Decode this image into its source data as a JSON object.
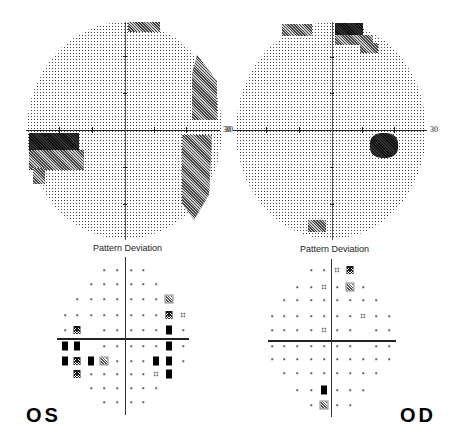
{
  "left_eye": {
    "label": "OS",
    "grey_scale": {
      "axis_label_right": "30"
    },
    "pattern_deviation": {
      "title": "Pattern Deviation",
      "points": [
        {
          "x": 104,
          "y": 270,
          "t": "dot"
        },
        {
          "x": 117,
          "y": 270,
          "t": "dot"
        },
        {
          "x": 131,
          "y": 270,
          "t": "dot"
        },
        {
          "x": 143,
          "y": 270,
          "t": "dot"
        },
        {
          "x": 91,
          "y": 284,
          "t": "dot"
        },
        {
          "x": 104,
          "y": 284,
          "t": "dot"
        },
        {
          "x": 117,
          "y": 284,
          "t": "dot"
        },
        {
          "x": 131,
          "y": 284,
          "t": "dot"
        },
        {
          "x": 143,
          "y": 284,
          "t": "dot"
        },
        {
          "x": 156,
          "y": 284,
          "t": "dot"
        },
        {
          "x": 77,
          "y": 299,
          "t": "dot"
        },
        {
          "x": 91,
          "y": 299,
          "t": "dot"
        },
        {
          "x": 104,
          "y": 299,
          "t": "dot"
        },
        {
          "x": 117,
          "y": 299,
          "t": "dot"
        },
        {
          "x": 131,
          "y": 299,
          "t": "dot"
        },
        {
          "x": 143,
          "y": 299,
          "t": "dot"
        },
        {
          "x": 156,
          "y": 299,
          "t": "dot"
        },
        {
          "x": 169,
          "y": 299,
          "t": "hatch"
        },
        {
          "x": 65,
          "y": 315,
          "t": "dot"
        },
        {
          "x": 77,
          "y": 315,
          "t": "dot"
        },
        {
          "x": 91,
          "y": 315,
          "t": "dot"
        },
        {
          "x": 104,
          "y": 315,
          "t": "dot"
        },
        {
          "x": 117,
          "y": 315,
          "t": "dot"
        },
        {
          "x": 131,
          "y": 315,
          "t": "dot"
        },
        {
          "x": 143,
          "y": 315,
          "t": "dot"
        },
        {
          "x": 156,
          "y": 315,
          "t": "dot"
        },
        {
          "x": 169,
          "y": 315,
          "t": "cross"
        },
        {
          "x": 183,
          "y": 315,
          "t": "4dot"
        },
        {
          "x": 65,
          "y": 330,
          "t": "dot"
        },
        {
          "x": 77,
          "y": 330,
          "t": "cross"
        },
        {
          "x": 104,
          "y": 330,
          "t": "dot"
        },
        {
          "x": 117,
          "y": 330,
          "t": "dot"
        },
        {
          "x": 131,
          "y": 330,
          "t": "dot"
        },
        {
          "x": 143,
          "y": 330,
          "t": "dot"
        },
        {
          "x": 156,
          "y": 330,
          "t": "dot"
        },
        {
          "x": 169,
          "y": 330,
          "t": "solid"
        },
        {
          "x": 183,
          "y": 330,
          "t": "dot"
        },
        {
          "x": 65,
          "y": 346,
          "t": "solid"
        },
        {
          "x": 77,
          "y": 346,
          "t": "solid"
        },
        {
          "x": 104,
          "y": 346,
          "t": "dot"
        },
        {
          "x": 117,
          "y": 346,
          "t": "dot"
        },
        {
          "x": 131,
          "y": 346,
          "t": "dot"
        },
        {
          "x": 143,
          "y": 346,
          "t": "dot"
        },
        {
          "x": 156,
          "y": 346,
          "t": "dot"
        },
        {
          "x": 169,
          "y": 346,
          "t": "solid"
        },
        {
          "x": 183,
          "y": 346,
          "t": "dot"
        },
        {
          "x": 65,
          "y": 361,
          "t": "solid"
        },
        {
          "x": 77,
          "y": 361,
          "t": "cross"
        },
        {
          "x": 91,
          "y": 361,
          "t": "solid"
        },
        {
          "x": 104,
          "y": 361,
          "t": "hatch"
        },
        {
          "x": 117,
          "y": 361,
          "t": "dot"
        },
        {
          "x": 131,
          "y": 361,
          "t": "dot"
        },
        {
          "x": 143,
          "y": 361,
          "t": "dot"
        },
        {
          "x": 156,
          "y": 361,
          "t": "solid"
        },
        {
          "x": 169,
          "y": 361,
          "t": "solid"
        },
        {
          "x": 183,
          "y": 361,
          "t": "dot"
        },
        {
          "x": 77,
          "y": 374,
          "t": "cross"
        },
        {
          "x": 91,
          "y": 374,
          "t": "dot"
        },
        {
          "x": 104,
          "y": 374,
          "t": "dot"
        },
        {
          "x": 117,
          "y": 374,
          "t": "dot"
        },
        {
          "x": 131,
          "y": 374,
          "t": "dot"
        },
        {
          "x": 143,
          "y": 374,
          "t": "dot"
        },
        {
          "x": 156,
          "y": 374,
          "t": "4dot"
        },
        {
          "x": 169,
          "y": 374,
          "t": "solid"
        },
        {
          "x": 91,
          "y": 388,
          "t": "dot"
        },
        {
          "x": 104,
          "y": 388,
          "t": "dot"
        },
        {
          "x": 117,
          "y": 388,
          "t": "dot"
        },
        {
          "x": 131,
          "y": 388,
          "t": "dot"
        },
        {
          "x": 143,
          "y": 388,
          "t": "dot"
        },
        {
          "x": 156,
          "y": 388,
          "t": "dot"
        },
        {
          "x": 104,
          "y": 402,
          "t": "dot"
        },
        {
          "x": 117,
          "y": 402,
          "t": "dot"
        },
        {
          "x": 131,
          "y": 402,
          "t": "dot"
        },
        {
          "x": 143,
          "y": 402,
          "t": "dot"
        }
      ]
    }
  },
  "right_eye": {
    "label": "OD",
    "grey_scale": {
      "axis_label_left": "30",
      "axis_label_right": "30"
    },
    "pattern_deviation": {
      "title": "Pattern Deviation",
      "points": [
        {
          "x": 311,
          "y": 270,
          "t": "dot"
        },
        {
          "x": 324,
          "y": 270,
          "t": "dot"
        },
        {
          "x": 337,
          "y": 270,
          "t": "4dot"
        },
        {
          "x": 350,
          "y": 270,
          "t": "cross"
        },
        {
          "x": 297,
          "y": 287,
          "t": "dot"
        },
        {
          "x": 311,
          "y": 287,
          "t": "dot"
        },
        {
          "x": 324,
          "y": 287,
          "t": "4dot"
        },
        {
          "x": 337,
          "y": 287,
          "t": "dot"
        },
        {
          "x": 350,
          "y": 287,
          "t": "hatch"
        },
        {
          "x": 363,
          "y": 287,
          "t": "dot"
        },
        {
          "x": 284,
          "y": 300,
          "t": "dot"
        },
        {
          "x": 297,
          "y": 300,
          "t": "dot"
        },
        {
          "x": 311,
          "y": 300,
          "t": "dot"
        },
        {
          "x": 324,
          "y": 300,
          "t": "dot"
        },
        {
          "x": 337,
          "y": 300,
          "t": "dot"
        },
        {
          "x": 350,
          "y": 300,
          "t": "dot"
        },
        {
          "x": 363,
          "y": 300,
          "t": "dot"
        },
        {
          "x": 376,
          "y": 300,
          "t": "dot"
        },
        {
          "x": 272,
          "y": 316,
          "t": "dot"
        },
        {
          "x": 284,
          "y": 316,
          "t": "dot"
        },
        {
          "x": 297,
          "y": 316,
          "t": "dot"
        },
        {
          "x": 311,
          "y": 316,
          "t": "dot"
        },
        {
          "x": 324,
          "y": 316,
          "t": "dot"
        },
        {
          "x": 337,
          "y": 316,
          "t": "dot"
        },
        {
          "x": 350,
          "y": 316,
          "t": "dot"
        },
        {
          "x": 363,
          "y": 316,
          "t": "4dot"
        },
        {
          "x": 376,
          "y": 316,
          "t": "dot"
        },
        {
          "x": 389,
          "y": 316,
          "t": "dot"
        },
        {
          "x": 272,
          "y": 330,
          "t": "dot"
        },
        {
          "x": 284,
          "y": 330,
          "t": "dot"
        },
        {
          "x": 297,
          "y": 330,
          "t": "dot"
        },
        {
          "x": 311,
          "y": 330,
          "t": "dot"
        },
        {
          "x": 324,
          "y": 330,
          "t": "4dot"
        },
        {
          "x": 337,
          "y": 330,
          "t": "dot"
        },
        {
          "x": 350,
          "y": 330,
          "t": "dot"
        },
        {
          "x": 376,
          "y": 330,
          "t": "dot"
        },
        {
          "x": 389,
          "y": 330,
          "t": "dot"
        },
        {
          "x": 272,
          "y": 346,
          "t": "dot"
        },
        {
          "x": 284,
          "y": 346,
          "t": "dot"
        },
        {
          "x": 297,
          "y": 346,
          "t": "dot"
        },
        {
          "x": 311,
          "y": 346,
          "t": "dot"
        },
        {
          "x": 324,
          "y": 346,
          "t": "dot"
        },
        {
          "x": 337,
          "y": 346,
          "t": "dot"
        },
        {
          "x": 350,
          "y": 346,
          "t": "dot"
        },
        {
          "x": 376,
          "y": 346,
          "t": "dot"
        },
        {
          "x": 389,
          "y": 346,
          "t": "dot"
        },
        {
          "x": 272,
          "y": 359,
          "t": "dot"
        },
        {
          "x": 284,
          "y": 359,
          "t": "dot"
        },
        {
          "x": 297,
          "y": 359,
          "t": "dot"
        },
        {
          "x": 311,
          "y": 359,
          "t": "dot"
        },
        {
          "x": 324,
          "y": 359,
          "t": "dot"
        },
        {
          "x": 337,
          "y": 359,
          "t": "dot"
        },
        {
          "x": 350,
          "y": 359,
          "t": "dot"
        },
        {
          "x": 363,
          "y": 359,
          "t": "dot"
        },
        {
          "x": 376,
          "y": 359,
          "t": "dot"
        },
        {
          "x": 389,
          "y": 359,
          "t": "dot"
        },
        {
          "x": 284,
          "y": 373,
          "t": "dot"
        },
        {
          "x": 297,
          "y": 373,
          "t": "dot"
        },
        {
          "x": 311,
          "y": 373,
          "t": "dot"
        },
        {
          "x": 324,
          "y": 373,
          "t": "dot"
        },
        {
          "x": 337,
          "y": 373,
          "t": "dot"
        },
        {
          "x": 350,
          "y": 373,
          "t": "dot"
        },
        {
          "x": 363,
          "y": 373,
          "t": "dot"
        },
        {
          "x": 376,
          "y": 373,
          "t": "dot"
        },
        {
          "x": 297,
          "y": 390,
          "t": "dot"
        },
        {
          "x": 311,
          "y": 390,
          "t": "dot"
        },
        {
          "x": 324,
          "y": 390,
          "t": "solid"
        },
        {
          "x": 337,
          "y": 390,
          "t": "dot"
        },
        {
          "x": 350,
          "y": 390,
          "t": "dot"
        },
        {
          "x": 363,
          "y": 390,
          "t": "dot"
        },
        {
          "x": 311,
          "y": 405,
          "t": "dot"
        },
        {
          "x": 324,
          "y": 405,
          "t": "hatch"
        },
        {
          "x": 337,
          "y": 405,
          "t": "dot"
        },
        {
          "x": 350,
          "y": 405,
          "t": "dot"
        }
      ]
    }
  }
}
